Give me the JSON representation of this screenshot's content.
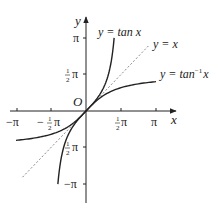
{
  "figure": {
    "type": "function-graph",
    "origin_label": "O",
    "x_axis_label": "x",
    "y_axis_label": "y",
    "x_ticks": [
      {
        "value": -3.14159,
        "label": "−π"
      },
      {
        "value": -1.5708,
        "label": "−½π"
      },
      {
        "value": 1.5708,
        "label": "½π"
      },
      {
        "value": 3.14159,
        "label": "π"
      }
    ],
    "y_ticks": [
      {
        "value": 3.14159,
        "label": "π"
      },
      {
        "value": 1.5708,
        "label": "½π"
      },
      {
        "value": -1.5708,
        "label": "−½π"
      },
      {
        "value": -3.14159,
        "label": "−π"
      }
    ],
    "curves": [
      {
        "name": "tan",
        "label": "y = tan x",
        "style": "solid",
        "x_range": [
          -1.263,
          1.263
        ]
      },
      {
        "name": "identity",
        "label": "y = x",
        "style": "dashed",
        "x_range": [
          -2.85,
          2.8
        ]
      },
      {
        "name": "arctan",
        "label": "y = tan⁻¹ x",
        "style": "solid",
        "x_range": [
          -3.14159,
          3.14159
        ]
      }
    ],
    "colors": {
      "axis": "#222222",
      "curve": "#222222",
      "dashed": "#666666"
    }
  },
  "labels": {
    "tan_prefix": "y = tan ",
    "tan_var": "x",
    "id_prefix": "y = ",
    "id_var": "x",
    "atan_prefix": "y = tan",
    "atan_sup": "−1",
    "atan_var": "x",
    "x_axis": "x",
    "y_axis": "y",
    "origin": "O",
    "xt_neg_pi": "−π",
    "xt_neg_half": "−",
    "xt_half": "",
    "xt_pi": "π",
    "yt_pi": "π",
    "yt_neg_pi": "−π",
    "pi": "π",
    "half_num": "1",
    "half_den": "2"
  }
}
